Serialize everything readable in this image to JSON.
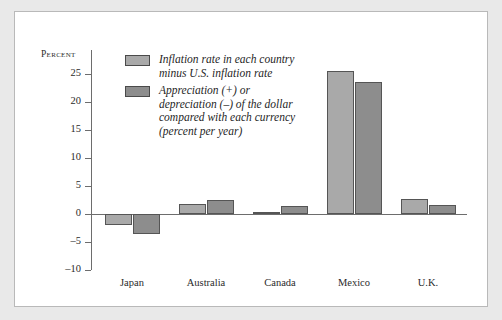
{
  "chart_data": {
    "type": "bar",
    "title": "",
    "subtitle": "",
    "xlabel": "",
    "ylabel": "Percent",
    "ylim": [
      -10,
      25
    ],
    "ytick_labels": [
      "25",
      "20",
      "15",
      "10",
      "5",
      "0",
      "-5",
      "-10"
    ],
    "ytick_values": [
      25,
      20,
      15,
      10,
      5,
      0,
      -5,
      -10
    ],
    "grid": false,
    "legend_position": "top-left-inside",
    "categories": [
      "Japan",
      "Australia",
      "Canada",
      "Mexico",
      "U.K."
    ],
    "series": [
      {
        "name": "Inflation rate in each country\nminus U.S. inflation rate",
        "color": "#a9a9a9",
        "values": [
          -2.0,
          1.8,
          0.3,
          25.5,
          2.6
        ]
      },
      {
        "name": "Appreciation (+) or\ndepreciation (–) of the dollar\ncompared with each currency\n(percent per year)",
        "color": "#8d8d8d",
        "values": [
          -3.6,
          2.5,
          1.5,
          23.5,
          1.6
        ]
      }
    ]
  },
  "colors": {
    "page_background": "#e9e9e9",
    "figure_background": "#ffffff",
    "figure_border": "#b9b9b9",
    "axis": "#6d6d6d",
    "text": "#2b2b2b",
    "series_light": "#a9a9a9",
    "series_dark": "#8d8d8d",
    "bar_outline": "#555555"
  }
}
